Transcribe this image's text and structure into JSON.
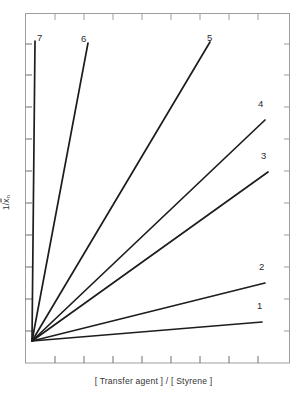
{
  "figure": {
    "background_color": "#ffffff",
    "line_color": "#1d1d1d",
    "frame_color": "#9a9a9a",
    "text_color": "#2b2b2b"
  },
  "axes": {
    "x_label": "[ Transfer agent ] / [ Styrene ]",
    "y_label_numerator": "1",
    "y_label_denominator_main": "x",
    "y_label_denominator_sub": "n",
    "y_label_plain": "1/x̄n",
    "x_tick_count": 8,
    "y_tick_count": 10,
    "x_ticks_labeled": false,
    "y_ticks_labeled": false,
    "frame": {
      "left": 25,
      "top": 13,
      "right": 290,
      "bottom": 363
    }
  },
  "chart_data": {
    "type": "line",
    "title": "",
    "subtitle": "",
    "xlabel": "[ Transfer agent ] / [ Styrene ]",
    "ylabel": "1/x̄n",
    "xlim": [
      0,
      1
    ],
    "ylim": [
      0,
      1
    ],
    "grid": false,
    "legend": "inline-end-labels",
    "axis_ticks_numeric": false,
    "origin_point": {
      "x": 0.026,
      "y": 0.063
    },
    "series": [
      {
        "name": "1",
        "label": "1",
        "slope_relative": 0.07,
        "x": [
          0.026,
          0.894
        ],
        "y": [
          0.063,
          0.117
        ],
        "end_px": {
          "x": 262,
          "y": 322
        },
        "label_px": {
          "x": 257,
          "y": 308
        }
      },
      {
        "name": "2",
        "label": "2",
        "slope_relative": 0.19,
        "x": [
          0.026,
          0.906
        ],
        "y": [
          0.063,
          0.229
        ],
        "end_px": {
          "x": 265,
          "y": 283
        },
        "label_px": {
          "x": 259,
          "y": 269
        }
      },
      {
        "name": "3",
        "label": "3",
        "slope_relative": 0.55,
        "x": [
          0.026,
          0.917
        ],
        "y": [
          0.063,
          0.546
        ],
        "end_px": {
          "x": 268,
          "y": 172
        },
        "label_px": {
          "x": 261,
          "y": 158
        }
      },
      {
        "name": "4",
        "label": "4",
        "slope_relative": 0.74,
        "x": [
          0.026,
          0.906
        ],
        "y": [
          0.063,
          0.694
        ],
        "end_px": {
          "x": 265,
          "y": 120
        },
        "label_px": {
          "x": 258,
          "y": 106
        }
      },
      {
        "name": "5",
        "label": "5",
        "slope_relative": 1.65,
        "x": [
          0.026,
          0.698
        ],
        "y": [
          0.063,
          0.917
        ],
        "end_px": {
          "x": 210,
          "y": 42
        },
        "label_px": {
          "x": 206,
          "y": 30
        }
      },
      {
        "name": "6",
        "label": "6",
        "slope_relative": 4.9,
        "x": [
          0.026,
          0.238
        ],
        "y": [
          0.063,
          0.914
        ],
        "end_px": {
          "x": 88,
          "y": 43
        },
        "label_px": {
          "x": 80,
          "y": 31
        }
      },
      {
        "name": "7",
        "label": "7",
        "slope_relative": 80.0,
        "x": [
          0.026,
          0.038
        ],
        "y": [
          0.063,
          0.92
        ],
        "end_px": {
          "x": 35,
          "y": 41
        },
        "label_px": {
          "x": 36,
          "y": 30
        }
      }
    ]
  },
  "labels": {
    "curve_1": "1",
    "curve_2": "2",
    "curve_3": "3",
    "curve_4": "4",
    "curve_5": "5",
    "curve_6": "6",
    "curve_7": "7"
  }
}
